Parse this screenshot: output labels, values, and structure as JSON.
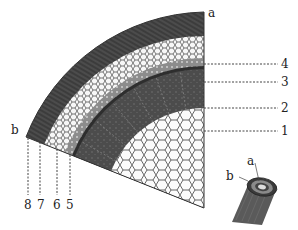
{
  "diagram": {
    "type": "stem-cross-section-quadrant",
    "colors": {
      "bark": "#3a3a3a",
      "cortex_bg": "#f4f4f4",
      "cell_wall": "#555555",
      "phloem": "#8a8a8a",
      "xylem": "#4a4a4a",
      "pith_bg": "#fbfbfb",
      "ink": "#222222"
    },
    "corner_labels": {
      "a": "a",
      "b": "b"
    },
    "right_labels": [
      {
        "id": "4",
        "text": "4"
      },
      {
        "id": "3",
        "text": "3"
      },
      {
        "id": "2",
        "text": "2"
      },
      {
        "id": "1",
        "text": "1"
      }
    ],
    "bottom_labels": [
      {
        "id": "8",
        "text": "8"
      },
      {
        "id": "7",
        "text": "7"
      },
      {
        "id": "6",
        "text": "6"
      },
      {
        "id": "5",
        "text": "5"
      }
    ],
    "inset": {
      "label_a": "a",
      "label_b": "b"
    }
  }
}
